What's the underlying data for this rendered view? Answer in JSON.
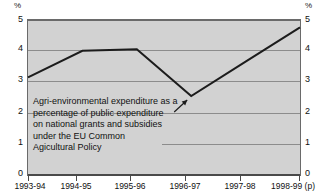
{
  "chart_data": {
    "type": "line",
    "title": "",
    "subtitle": "",
    "xlabel": "",
    "ylabel": "%",
    "ylabel_right": "%",
    "categories": [
      "1993-94",
      "1994-95",
      "1995-96",
      "1996-97",
      "1997-98",
      "1998-99 (p)"
    ],
    "values": [
      3.1,
      3.95,
      4.0,
      2.5,
      3.6,
      4.7
    ],
    "series": [
      {
        "name": "Agri-environmental expenditure as a percentage of public expenditure on national grants and subsidies under the EU Common Agicultural Policy",
        "values": [
          3.1,
          3.95,
          4.0,
          2.5,
          3.6,
          4.7
        ]
      }
    ],
    "ylim": [
      0,
      5
    ],
    "yticks": [
      0,
      1,
      2,
      3,
      4,
      5
    ],
    "ytick_labels": [
      "0",
      "1",
      "2",
      "3",
      "4",
      "5"
    ],
    "grid": true,
    "legend": "none",
    "annotations": [
      {
        "name": "series-callout",
        "lines": [
          "Agri-environmental expenditure as a",
          "percentage of public expenditure",
          "on national grants and subsidies",
          "under the EU Common",
          "Agicultural Policy"
        ],
        "points_to_category": "1996-97",
        "points_to_value": 2.5
      }
    ],
    "colors": {
      "plot_background": "#d2d2d2",
      "grid": "#8c8c8c",
      "line": "#1c1c1c",
      "axis": "#4a4a4a",
      "text": "#111111",
      "page_background": "#ffffff"
    }
  },
  "axis": {
    "y_unit_left": "%",
    "y_unit_right": "%",
    "y_ticks": [
      "5",
      "4",
      "3",
      "2",
      "1",
      "0"
    ],
    "x_ticks": [
      "1993-94",
      "1994-95",
      "1995-96",
      "1996-97",
      "1997-98",
      "1998-99 (p)"
    ]
  },
  "annotation": {
    "line1": "Agri-environmental expenditure as a",
    "line2": "percentage of public expenditure",
    "line3": "on national grants and subsidies",
    "line4": "under the EU Common",
    "line5": "Agicultural Policy"
  }
}
